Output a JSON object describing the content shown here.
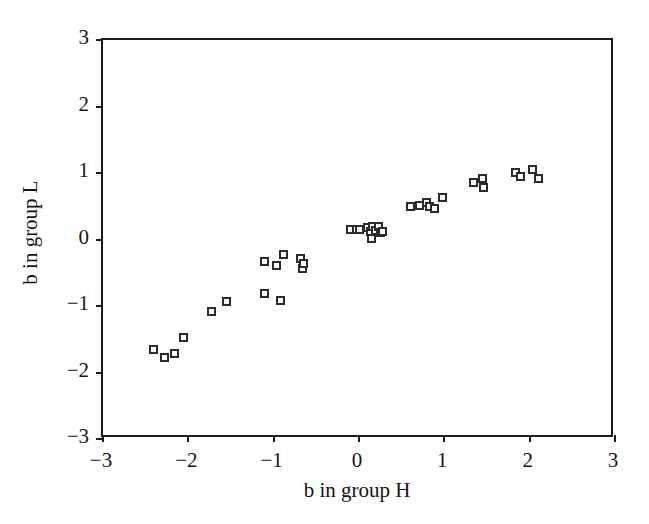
{
  "chart_data": {
    "type": "scatter",
    "title": "",
    "xlabel": "b in group H",
    "ylabel": "b in group L",
    "xlim": [
      -3,
      3
    ],
    "ylim": [
      -3,
      3
    ],
    "xticks": [
      -3,
      -2,
      -1,
      0,
      1,
      2,
      3
    ],
    "yticks": [
      -3,
      -2,
      -1,
      0,
      1,
      2,
      3
    ],
    "xtick_labels": [
      "−3",
      "−2",
      "−1",
      "0",
      "1",
      "2",
      "3"
    ],
    "ytick_labels": [
      "3",
      "2",
      "1",
      "0",
      "−1",
      "−2",
      "−3"
    ],
    "grid": false,
    "legend": null,
    "marker": "open-square",
    "marker_color": "#2b2b2b",
    "points": [
      {
        "x": -2.41,
        "y": -1.66
      },
      {
        "x": -2.28,
        "y": -1.77
      },
      {
        "x": -2.16,
        "y": -1.71
      },
      {
        "x": -2.06,
        "y": -1.47
      },
      {
        "x": -1.73,
        "y": -1.09
      },
      {
        "x": -1.55,
        "y": -0.93
      },
      {
        "x": -1.11,
        "y": -0.81
      },
      {
        "x": -0.92,
        "y": -0.92
      },
      {
        "x": -1.11,
        "y": -0.33
      },
      {
        "x": -0.97,
        "y": -0.39
      },
      {
        "x": -0.88,
        "y": -0.22
      },
      {
        "x": -0.69,
        "y": -0.29
      },
      {
        "x": -0.66,
        "y": -0.43
      },
      {
        "x": -0.65,
        "y": -0.36
      },
      {
        "x": -0.1,
        "y": 0.15
      },
      {
        "x": -0.03,
        "y": 0.15
      },
      {
        "x": 0.01,
        "y": 0.15
      },
      {
        "x": 0.1,
        "y": 0.18
      },
      {
        "x": 0.13,
        "y": 0.12
      },
      {
        "x": 0.16,
        "y": 0.19
      },
      {
        "x": 0.19,
        "y": 0.13
      },
      {
        "x": 0.15,
        "y": 0.01
      },
      {
        "x": 0.23,
        "y": 0.19
      },
      {
        "x": 0.25,
        "y": 0.11
      },
      {
        "x": 0.28,
        "y": 0.12
      },
      {
        "x": 0.6,
        "y": 0.49
      },
      {
        "x": 0.71,
        "y": 0.51
      },
      {
        "x": 0.79,
        "y": 0.56
      },
      {
        "x": 0.83,
        "y": 0.5
      },
      {
        "x": 0.88,
        "y": 0.47
      },
      {
        "x": 0.98,
        "y": 0.63
      },
      {
        "x": 1.34,
        "y": 0.85
      },
      {
        "x": 1.45,
        "y": 0.91
      },
      {
        "x": 1.46,
        "y": 0.78
      },
      {
        "x": 1.83,
        "y": 1.01
      },
      {
        "x": 1.89,
        "y": 0.94
      },
      {
        "x": 2.03,
        "y": 1.05
      },
      {
        "x": 2.1,
        "y": 0.92
      }
    ]
  }
}
